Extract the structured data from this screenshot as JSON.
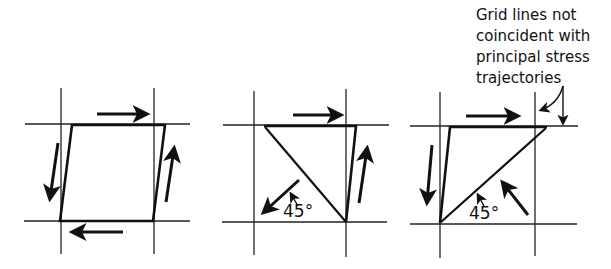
{
  "figure": {
    "panels": [
      {
        "id": "pure-shear-element",
        "description": "Sheared element with shear arrows on all four sides"
      },
      {
        "id": "shear-with-diagonal-compression-down-left",
        "angle_label": "45°"
      },
      {
        "id": "shear-with-diagonal-compression-up-left",
        "angle_label": "45°"
      }
    ],
    "annotation": {
      "lines": [
        "Grid lines not",
        "coincident with",
        "principal stress",
        "trajectories"
      ]
    }
  }
}
